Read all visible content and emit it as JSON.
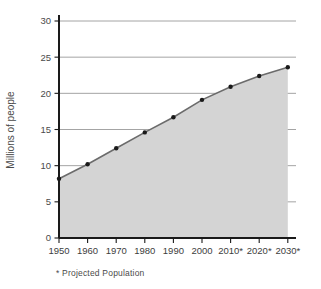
{
  "chart_data": {
    "type": "area",
    "title": "",
    "xlabel": "",
    "ylabel": "Millions of people",
    "categories": [
      "1950",
      "1960",
      "1970",
      "1980",
      "1990",
      "2000",
      "2010*",
      "2020*",
      "2030*"
    ],
    "values": [
      8.2,
      10.2,
      12.4,
      14.6,
      16.7,
      19.1,
      20.9,
      22.4,
      23.6
    ],
    "series": [
      {
        "name": "Population",
        "values": [
          8.2,
          10.2,
          12.4,
          14.6,
          16.7,
          19.1,
          20.9,
          22.4,
          23.6
        ]
      }
    ],
    "ylim": [
      0,
      30
    ],
    "yticks": [
      0,
      5,
      10,
      15,
      20,
      25,
      30
    ],
    "ytick_labels": [
      "0",
      "5",
      "10",
      "15",
      "20",
      "25",
      "30"
    ],
    "grid": true,
    "legend": "none",
    "markers": true,
    "fill_color": "#d4d4d4",
    "line_color": "#6b6b6b",
    "marker_color": "#1a1a1a",
    "grid_color": "#9a9a9a",
    "axis_color": "#1a1a1a"
  },
  "footnote": {
    "text": "* Projected Population"
  },
  "axis_labels": {
    "y_title": "Millions of people"
  }
}
